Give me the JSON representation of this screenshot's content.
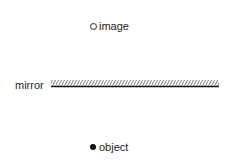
{
  "diagram": {
    "image_label": "image",
    "mirror_label": "mirror",
    "object_label": "object",
    "image_marker": "hollow-circle",
    "object_marker": "filled-circle",
    "colors": {
      "line": "#111111",
      "hatch": "#555555",
      "text": "#222222"
    }
  }
}
